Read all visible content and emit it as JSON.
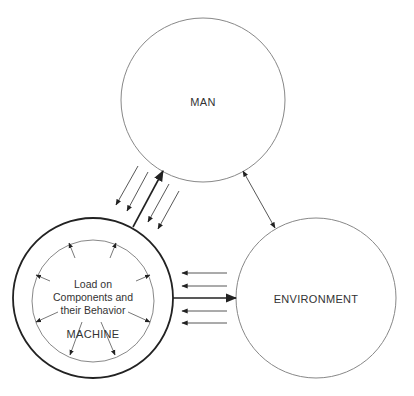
{
  "diagram": {
    "nodes": {
      "man": {
        "label": "MAN"
      },
      "environment": {
        "label": "ENVIRONMENT"
      },
      "machine": {
        "label": "MACHINE",
        "inner_lines": [
          "Load on",
          "Components and",
          "their Behavior"
        ]
      }
    },
    "edges": [
      {
        "from": "machine",
        "to": "man",
        "style": "thick",
        "label": ""
      },
      {
        "from": "man",
        "to": "machine",
        "style": "thin-parallel-arrows",
        "count": 4
      },
      {
        "from": "man",
        "to": "environment",
        "style": "bidirectional"
      },
      {
        "from": "machine",
        "to": "environment",
        "style": "thick"
      },
      {
        "from": "environment",
        "to": "machine",
        "style": "thin-parallel-arrows",
        "count": 4
      }
    ],
    "colors": {
      "line": "#555555",
      "thick_line": "#222222",
      "text": "#333333"
    }
  }
}
